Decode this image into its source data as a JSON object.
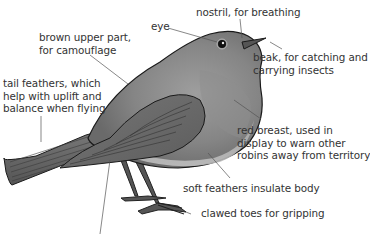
{
  "diagram": {
    "subject": "robin",
    "colors": {
      "background": "#ffffff",
      "text": "#333333",
      "leader_line": "#555555",
      "bird_body": "#8a8a8a",
      "bird_dark": "#5a5a5a",
      "bird_light": "#b5b5b5",
      "outline": "#1a1a1a"
    },
    "labels": {
      "eye": "eye",
      "nostril": "nostril, for breathing",
      "brown_upper": "brown upper part,\nfor camouflage",
      "beak": "beak, for catching and\ncarrying insects",
      "tail": "tail feathers, which\nhelp with uplift and\nbalance when flying",
      "red_breast": "red breast, used in\ndisplay to warn other\nrobins away from territory",
      "soft_feathers": "soft feathers insulate body",
      "clawed_toes": "clawed toes for gripping"
    }
  }
}
